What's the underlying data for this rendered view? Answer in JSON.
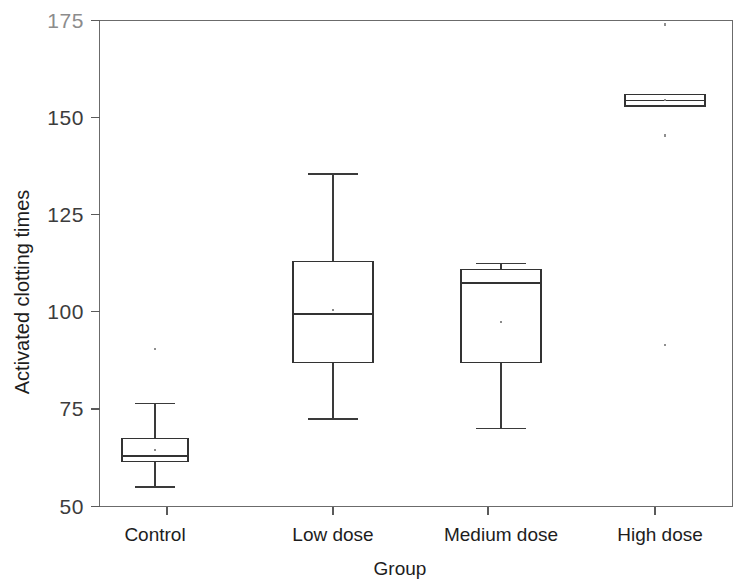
{
  "chart_data": {
    "type": "box",
    "title": "",
    "xlabel": "Group",
    "ylabel": "Activated clotting times",
    "categories": [
      "Control",
      "Low dose",
      "Medium dose",
      "High dose"
    ],
    "ylim": [
      50,
      175
    ],
    "yticks": [
      50,
      75,
      100,
      125,
      150,
      175
    ],
    "ytick_labels": [
      "50",
      "75",
      "100",
      "125",
      "150",
      "175"
    ],
    "grid": false,
    "legend": "none",
    "boxes": [
      {
        "category": "Control",
        "whisker_low": 55,
        "q1": 61.5,
        "median": 63,
        "q3": 67.5,
        "whisker_high": 76.5,
        "mean": 64.5,
        "outliers": [
          90.5
        ]
      },
      {
        "category": "Low dose",
        "whisker_low": 72.5,
        "q1": 87,
        "median": 99.5,
        "q3": 113,
        "whisker_high": 135.5,
        "mean": 100.5,
        "outliers": []
      },
      {
        "category": "Medium dose",
        "whisker_low": 70,
        "q1": 87,
        "median": 107.5,
        "q3": 111,
        "whisker_high": 112.5,
        "mean": 97.5,
        "outliers": []
      },
      {
        "category": "High dose",
        "whisker_low": 153,
        "q1": 153,
        "median": 154.5,
        "q3": 156,
        "whisker_high": 156,
        "mean": 154.5,
        "outliers": [
          174,
          145.5,
          91.5
        ]
      }
    ]
  },
  "yticks": {
    "t175": "175",
    "t150": "150",
    "t125": "125",
    "t100": "100",
    "t75": "75",
    "t50": "50"
  },
  "xticks": {
    "c0": "Control",
    "c1": "Low dose",
    "c2": "Medium dose",
    "c3": "High dose"
  },
  "labels": {
    "x_axis_title": "Group",
    "y_axis_title": "Activated clotting times"
  }
}
